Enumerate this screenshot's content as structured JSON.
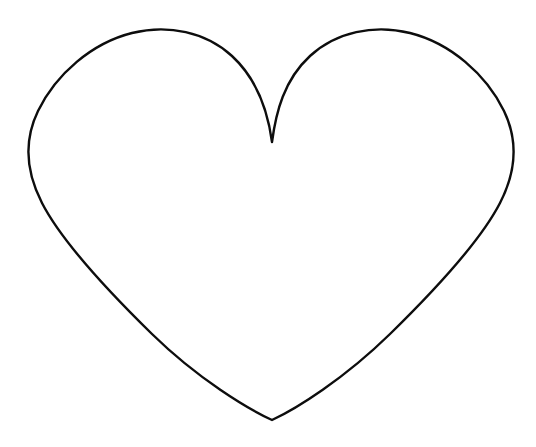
{
  "document": {
    "title": "Heart Outline",
    "width": 536,
    "height": 447,
    "background_color": "#ffffff",
    "description": "Simple black line-art outline of a heart shape centered on a plain white background. No text, labels, or interface elements are present."
  },
  "artwork": {
    "name": "heart-outline",
    "shape": "heart",
    "style": "line-art outline, unfilled",
    "stroke_color": "#0d0d0d",
    "fill_color": "none",
    "stroke_width": 2.4,
    "geometry": {
      "top_cleft_point": {
        "x": 272,
        "y": 142
      },
      "bottom_tip_point": {
        "x": 272,
        "y": 420
      },
      "leftmost_point": {
        "x": 29,
        "y": 136
      },
      "rightmost_point": {
        "x": 508,
        "y": 140
      },
      "left_lobe_apex": {
        "x": 155,
        "y": 31
      },
      "right_lobe_apex": {
        "x": 390,
        "y": 31
      },
      "path": "M 272 142 C 268 112 258 80 232 56 C 206 32 168 24 132 33 C 92 43 56 74 38 111 C 24 140 26 172 42 203 C 60 238 106 289 152 334 C 198 379 248 409 272 420 C 296 409 344 379 390 334 C 436 289 482 238 500 203 C 516 172 518 140 504 111 C 486 74 450 43 410 33 C 374 24 336 32 310 56 C 284 80 276 112 272 142 Z"
    }
  }
}
